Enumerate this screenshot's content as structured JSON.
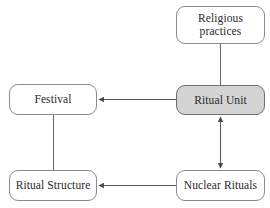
{
  "diagram": {
    "canvas": {
      "width": 270,
      "height": 208
    },
    "colors": {
      "background": "#ffffff",
      "node_fill": "#ffffff",
      "highlight_fill": "#d3d3d3",
      "border": "#8a8a8a",
      "edge": "#5a5a5a",
      "text": "#2a2a2a"
    },
    "nodes": [
      {
        "id": "religious-practices",
        "label": "Religious\npractices",
        "highlighted": false
      },
      {
        "id": "ritual-unit",
        "label": "Ritual Unit",
        "highlighted": true
      },
      {
        "id": "festival",
        "label": "Festival",
        "highlighted": false
      },
      {
        "id": "ritual-structure",
        "label": "Ritual Structure",
        "highlighted": false
      },
      {
        "id": "nuclear-rituals",
        "label": "Nuclear Rituals",
        "highlighted": false
      }
    ],
    "edges": [
      {
        "id": "religious-practices-to-ritual-unit",
        "from": "religious-practices",
        "to": "ritual-unit",
        "arrow": "none",
        "orientation": "vertical"
      },
      {
        "id": "ritual-unit-to-festival",
        "from": "ritual-unit",
        "to": "festival",
        "arrow": "single",
        "orientation": "horizontal"
      },
      {
        "id": "ritual-unit-to-nuclear-rituals",
        "from": "ritual-unit",
        "to": "nuclear-rituals",
        "arrow": "double",
        "orientation": "vertical"
      },
      {
        "id": "nuclear-rituals-to-ritual-structure",
        "from": "nuclear-rituals",
        "to": "ritual-structure",
        "arrow": "single",
        "orientation": "horizontal"
      },
      {
        "id": "festival-to-ritual-structure",
        "from": "festival",
        "to": "ritual-structure",
        "arrow": "none",
        "orientation": "vertical"
      }
    ]
  }
}
